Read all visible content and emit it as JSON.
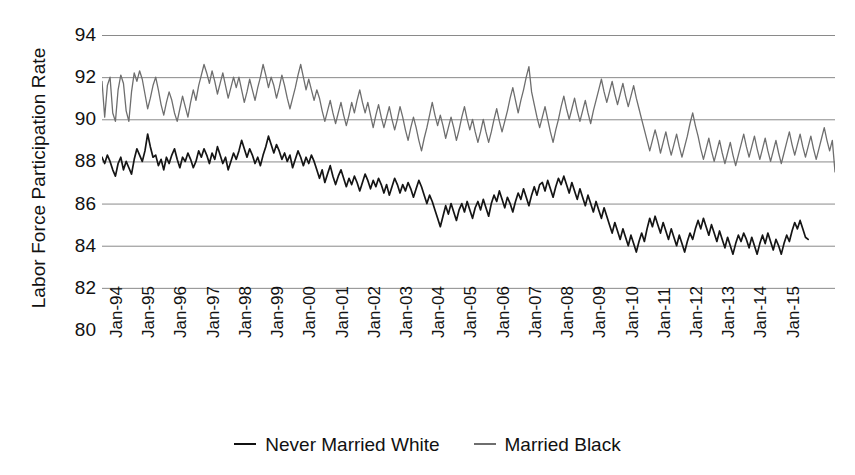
{
  "chart_data": {
    "type": "line",
    "title": "",
    "xlabel": "",
    "ylabel": "Labor Force Participation Rate",
    "ylim": [
      80,
      94
    ],
    "yticks": [
      94,
      92,
      90,
      88,
      86,
      84,
      82,
      80
    ],
    "grid": true,
    "legend_position": "bottom",
    "x_tick_labels": [
      "Jan-94",
      "Jan-95",
      "Jan-96",
      "Jan-97",
      "Jan-98",
      "Jan-99",
      "Jan-00",
      "Jan-01",
      "Jan-02",
      "Jan-03",
      "Jan-04",
      "Jan-05",
      "Jan-06",
      "Jan-07",
      "Jan-08",
      "Jan-09",
      "Jan-10",
      "Jan-11",
      "Jan-12",
      "Jan-13",
      "Jan-14",
      "Jan-15"
    ],
    "x_start": "Jan-94",
    "x_end": "Jul-15",
    "x_frequency": "monthly",
    "series": [
      {
        "name": "Never Married White",
        "color": "#151515",
        "values": [
          88.2,
          87.9,
          88.3,
          88.0,
          87.6,
          87.3,
          87.9,
          88.2,
          87.6,
          88.0,
          87.7,
          87.4,
          88.1,
          88.6,
          88.3,
          88.0,
          88.5,
          89.3,
          88.7,
          88.2,
          88.3,
          87.8,
          88.1,
          87.6,
          88.2,
          87.9,
          88.3,
          88.6,
          88.1,
          87.7,
          88.2,
          88.0,
          88.4,
          88.1,
          87.7,
          88.0,
          88.5,
          88.2,
          88.6,
          88.3,
          87.9,
          88.4,
          88.1,
          88.7,
          88.3,
          87.9,
          88.2,
          87.6,
          88.0,
          88.4,
          88.1,
          88.5,
          89.0,
          88.6,
          88.2,
          88.6,
          88.3,
          87.9,
          88.2,
          87.8,
          88.3,
          88.7,
          89.2,
          88.8,
          88.4,
          88.8,
          88.5,
          88.1,
          88.4,
          88.0,
          88.3,
          87.7,
          88.1,
          88.5,
          88.2,
          87.8,
          88.2,
          87.9,
          88.3,
          88.0,
          87.6,
          87.2,
          87.6,
          87.0,
          87.4,
          87.8,
          87.3,
          86.9,
          87.3,
          87.6,
          87.2,
          86.8,
          87.2,
          86.9,
          87.3,
          87.0,
          86.6,
          87.0,
          87.4,
          87.1,
          86.7,
          87.1,
          86.8,
          87.2,
          86.9,
          86.5,
          86.9,
          86.4,
          86.8,
          87.2,
          86.9,
          86.5,
          86.9,
          86.6,
          87.0,
          86.7,
          86.3,
          86.7,
          87.1,
          86.8,
          86.4,
          86.0,
          86.4,
          86.1,
          85.7,
          85.3,
          84.9,
          85.4,
          85.9,
          85.5,
          86.0,
          85.6,
          85.2,
          85.7,
          86.0,
          85.6,
          86.1,
          85.7,
          85.3,
          85.8,
          86.1,
          85.7,
          86.2,
          85.8,
          85.4,
          86.0,
          86.4,
          86.1,
          86.6,
          86.2,
          85.8,
          86.3,
          86.0,
          85.6,
          86.1,
          86.5,
          86.2,
          86.7,
          86.3,
          85.9,
          86.4,
          86.8,
          86.4,
          86.9,
          87.0,
          86.6,
          87.1,
          86.7,
          86.3,
          86.8,
          87.2,
          86.9,
          87.3,
          86.9,
          86.5,
          87.0,
          86.6,
          86.2,
          86.7,
          86.3,
          85.9,
          86.4,
          86.0,
          85.6,
          86.1,
          85.7,
          85.3,
          85.8,
          85.4,
          85.0,
          84.6,
          85.1,
          84.7,
          84.3,
          84.8,
          84.4,
          84.0,
          84.5,
          84.1,
          83.7,
          84.2,
          84.6,
          84.2,
          84.8,
          85.3,
          84.9,
          85.4,
          85.0,
          84.6,
          85.1,
          84.7,
          84.3,
          84.8,
          84.4,
          84.0,
          84.5,
          84.1,
          83.7,
          84.2,
          84.6,
          84.3,
          84.8,
          85.2,
          84.8,
          85.3,
          84.9,
          84.5,
          85.0,
          84.6,
          84.2,
          84.7,
          84.3,
          83.9,
          84.4,
          84.0,
          83.6,
          84.1,
          84.5,
          84.2,
          84.6,
          84.3,
          83.9,
          84.4,
          84.0,
          83.6,
          84.1,
          84.5,
          84.1,
          84.6,
          84.2,
          83.8,
          84.3,
          84.0,
          83.6,
          84.1,
          84.5,
          84.2,
          84.7,
          85.1,
          84.8,
          85.2,
          84.8,
          84.4,
          84.3
        ]
      },
      {
        "name": "Married Black",
        "color": "#6e6e6e",
        "values": [
          91.8,
          90.1,
          91.6,
          92.0,
          90.3,
          89.9,
          91.4,
          92.1,
          91.7,
          90.4,
          89.9,
          91.3,
          92.2,
          91.8,
          92.3,
          91.9,
          91.2,
          90.5,
          91.0,
          91.6,
          92.0,
          91.4,
          90.7,
          90.2,
          90.8,
          91.3,
          90.9,
          90.3,
          89.9,
          90.5,
          91.1,
          90.6,
          90.1,
          90.8,
          91.4,
          90.9,
          91.6,
          92.1,
          92.6,
          92.2,
          91.7,
          92.3,
          91.8,
          91.2,
          91.7,
          92.2,
          91.6,
          91.0,
          91.5,
          92.0,
          91.5,
          92.0,
          91.4,
          90.8,
          91.3,
          91.9,
          91.4,
          90.9,
          91.5,
          92.0,
          92.6,
          92.1,
          91.5,
          92.0,
          91.6,
          91.0,
          91.5,
          92.1,
          91.6,
          91.0,
          90.5,
          91.0,
          91.5,
          92.1,
          92.6,
          92.0,
          91.4,
          91.9,
          91.4,
          90.9,
          91.4,
          91.0,
          90.4,
          89.9,
          90.4,
          90.9,
          90.3,
          89.8,
          90.3,
          90.8,
          90.2,
          89.7,
          90.2,
          90.8,
          90.3,
          90.9,
          91.4,
          90.8,
          90.3,
          90.8,
          90.2,
          89.6,
          90.2,
          90.7,
          90.1,
          89.6,
          90.1,
          90.6,
          90.0,
          89.5,
          90.0,
          90.6,
          90.1,
          89.5,
          89.0,
          89.6,
          90.1,
          89.6,
          89.0,
          88.5,
          89.1,
          89.6,
          90.2,
          90.8,
          90.2,
          89.7,
          90.2,
          89.7,
          89.1,
          89.6,
          90.1,
          89.6,
          89.0,
          89.5,
          90.1,
          90.6,
          90.0,
          89.5,
          90.0,
          89.4,
          88.9,
          89.4,
          90.0,
          89.4,
          88.9,
          89.4,
          90.0,
          90.5,
          89.9,
          89.4,
          89.9,
          90.4,
          91.0,
          91.5,
          90.9,
          90.3,
          90.9,
          91.4,
          92.0,
          92.5,
          91.3,
          90.7,
          90.1,
          89.6,
          90.1,
          90.6,
          90.0,
          89.4,
          88.9,
          89.5,
          90.0,
          90.6,
          91.1,
          90.5,
          90.0,
          90.5,
          91.0,
          90.4,
          89.9,
          90.4,
          90.9,
          90.3,
          89.8,
          90.4,
          90.9,
          91.4,
          91.9,
          91.3,
          90.8,
          91.3,
          91.8,
          91.2,
          90.7,
          91.2,
          91.7,
          91.1,
          90.6,
          91.1,
          91.6,
          91.0,
          90.5,
          90.0,
          89.5,
          89.0,
          88.5,
          89.0,
          89.5,
          89.0,
          88.4,
          88.9,
          89.4,
          88.8,
          88.3,
          88.8,
          89.3,
          88.7,
          88.2,
          88.7,
          89.2,
          89.8,
          90.3,
          89.7,
          89.2,
          88.6,
          88.1,
          88.6,
          89.1,
          88.5,
          88.0,
          88.5,
          89.0,
          88.4,
          87.9,
          88.4,
          88.9,
          88.3,
          87.8,
          88.3,
          88.8,
          89.3,
          88.7,
          88.2,
          88.7,
          89.2,
          88.6,
          88.1,
          88.6,
          89.1,
          88.5,
          88.0,
          88.5,
          89.0,
          88.4,
          87.9,
          88.4,
          88.9,
          89.4,
          88.8,
          88.3,
          88.8,
          89.3,
          88.7,
          88.2,
          88.7,
          89.2,
          88.6,
          88.1,
          88.6,
          89.1,
          89.6,
          89.0,
          88.5,
          89.0,
          87.5
        ]
      }
    ]
  },
  "legend": [
    {
      "label": "Never Married White",
      "swatch": "line-swatch-dark"
    },
    {
      "label": "Married Black",
      "swatch": "line-swatch-gray"
    }
  ],
  "axes": {
    "y_title": "Labor Force Participation Rate"
  }
}
